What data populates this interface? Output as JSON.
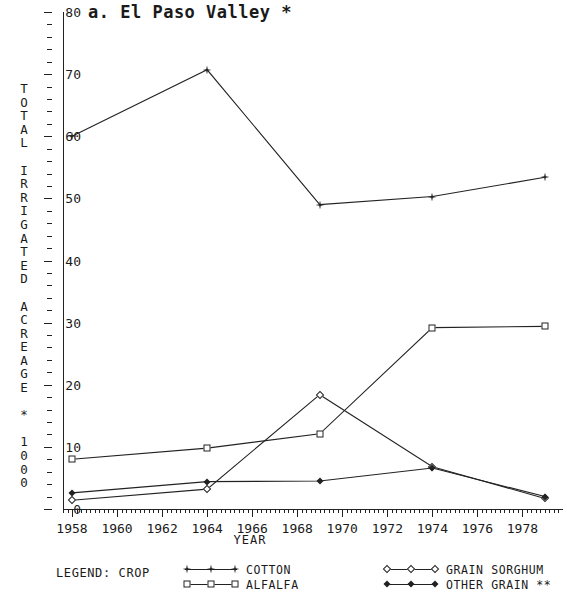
{
  "chart_data": {
    "type": "line",
    "title": "a. El Paso Valley *",
    "xlabel": "YEAR",
    "ylabel": "TOTAL IRRIGATED ACREAGE * 1000",
    "xlim": [
      1957.6,
      1979.8
    ],
    "ylim": [
      0,
      80
    ],
    "xticks": [
      1958,
      1960,
      1962,
      1964,
      1966,
      1968,
      1970,
      1972,
      1974,
      1976,
      1978
    ],
    "yticks": [
      0,
      10,
      20,
      30,
      40,
      50,
      60,
      70,
      80
    ],
    "grid": false,
    "legend_position": "below-plot",
    "x": [
      1958,
      1964,
      1969,
      1974,
      1979
    ],
    "series": [
      {
        "name": "COTTON",
        "marker": "star",
        "values": [
          60.0,
          70.7,
          49.0,
          50.3,
          53.4
        ]
      },
      {
        "name": "ALFALFA",
        "marker": "square",
        "values": [
          8.0,
          9.8,
          12.1,
          29.2,
          29.4
        ]
      },
      {
        "name": "GRAIN SORGHUM",
        "marker": "diamond",
        "values": [
          1.4,
          3.2,
          18.4,
          6.8,
          1.7
        ]
      },
      {
        "name": "OTHER GRAIN **",
        "marker": "smalldiamond",
        "values": [
          2.6,
          4.4,
          4.5,
          6.6,
          2.0
        ]
      }
    ]
  },
  "legend": {
    "heading": "LEGEND: CROP",
    "entries": [
      {
        "label": "COTTON",
        "marker": "star"
      },
      {
        "label": "ALFALFA",
        "marker": "square"
      },
      {
        "label": "GRAIN SORGHUM",
        "marker": "diamond"
      },
      {
        "label": "OTHER GRAIN **",
        "marker": "smalldiamond"
      }
    ]
  },
  "axis": {
    "y_title_chars": [
      "T",
      "O",
      "T",
      "A",
      "L",
      " ",
      "I",
      "R",
      "R",
      "I",
      "G",
      "A",
      "T",
      "E",
      "D",
      " ",
      "A",
      "C",
      "R",
      "E",
      "A",
      "G",
      "E",
      " ",
      "*",
      " ",
      "1",
      "0",
      "0",
      "0"
    ],
    "x_title": "YEAR"
  }
}
